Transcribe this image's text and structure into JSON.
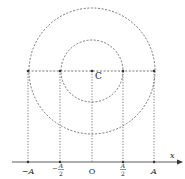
{
  "diagram": {
    "center_label": "C",
    "axis_label": "x",
    "origin_label": "O",
    "ticks": [
      {
        "label": "−A",
        "kind": "simple",
        "x": 28
      },
      {
        "num": "A",
        "den": "2",
        "sign": "−",
        "kind": "frac",
        "x": 60
      },
      {
        "label": "O",
        "kind": "simple",
        "x": 92
      },
      {
        "num": "A",
        "den": "2",
        "sign": "",
        "kind": "frac",
        "x": 123
      },
      {
        "label": "A",
        "kind": "simple",
        "x": 154
      }
    ],
    "circles": [
      {
        "name": "outer-circle",
        "radius_label": "A",
        "r": 63
      },
      {
        "name": "inner-circle",
        "radius_label": "A/2",
        "r": 31
      }
    ],
    "center": {
      "x": 92,
      "y": 71
    },
    "axis_y": 162,
    "colors": {
      "line": "#555555",
      "dot": "#333333",
      "text": "#222222"
    }
  }
}
